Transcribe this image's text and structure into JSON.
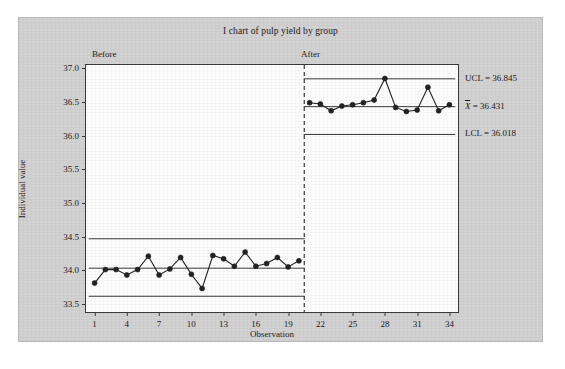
{
  "figure": {
    "title": "I chart of pulp yield by group",
    "background_color": "#d2d2d2",
    "panel_color": "#fdfdfd",
    "line_color": "#3a3a3a",
    "marker_color": "#222222"
  },
  "axes": {
    "ylabel": "Individual value",
    "xlabel": "Observation",
    "yticks": [
      "33.5",
      "34.0",
      "34.5",
      "35.0",
      "35.5",
      "36.0",
      "36.5",
      "37.0"
    ],
    "ytick_values": [
      33.5,
      34.0,
      34.5,
      35.0,
      35.5,
      36.0,
      36.5,
      37.0
    ],
    "ylim": [
      33.38,
      37.05
    ],
    "xticks": [
      "1",
      "4",
      "7",
      "10",
      "13",
      "16",
      "19",
      "22",
      "25",
      "28",
      "31",
      "34"
    ],
    "xtick_values": [
      1,
      4,
      7,
      10,
      13,
      16,
      19,
      22,
      25,
      28,
      31,
      34
    ],
    "xlim": [
      0.2,
      34.8
    ]
  },
  "groups": [
    {
      "name": "Before",
      "label": "Before"
    },
    {
      "name": "After",
      "label": "After"
    }
  ],
  "annotations": {
    "ucl": "UCL = 36.845",
    "center": "36.431",
    "center_symbol": "X",
    "center_equals": " = ",
    "lcl": "LCL = 36.018"
  },
  "chart_data": {
    "type": "line",
    "title": "I chart of pulp yield by group",
    "xlabel": "Observation",
    "ylabel": "Individual value",
    "ylim": [
      33.38,
      37.05
    ],
    "xlim": [
      0.2,
      34.8
    ],
    "grid": false,
    "legend": "none",
    "stage_divider_x": 20.5,
    "series": [
      {
        "name": "Before",
        "x": [
          1,
          2,
          3,
          4,
          5,
          6,
          7,
          8,
          9,
          10,
          11,
          12,
          13,
          14,
          15,
          16,
          17,
          18,
          19,
          20
        ],
        "values": [
          33.81,
          34.01,
          34.01,
          33.93,
          34.01,
          34.21,
          33.93,
          34.02,
          34.19,
          33.94,
          33.73,
          34.22,
          34.17,
          34.06,
          34.27,
          34.06,
          34.1,
          34.19,
          34.05,
          34.14
        ],
        "center_line": 34.031,
        "ucl": 34.468,
        "lcl": 33.614
      },
      {
        "name": "After",
        "x": [
          21,
          22,
          23,
          24,
          25,
          26,
          27,
          28,
          29,
          30,
          31,
          32,
          33,
          34
        ],
        "values": [
          36.49,
          36.47,
          36.37,
          36.44,
          36.46,
          36.49,
          36.53,
          36.85,
          36.42,
          36.36,
          36.38,
          36.72,
          36.37,
          36.46
        ],
        "center_line": 36.431,
        "ucl": 36.845,
        "lcl": 36.018
      }
    ],
    "annotations": [
      "UCL = 36.845",
      "X̄ = 36.431",
      "LCL = 36.018"
    ]
  }
}
